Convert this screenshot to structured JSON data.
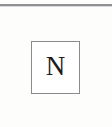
{
  "document": {
    "type": "scanned-page-fragment",
    "background_color": "#fdfdfc"
  },
  "rule": {
    "name": "horizontal-rule",
    "color": "#8f9093"
  },
  "label_box": {
    "name": "north-indicator-box",
    "letter": "N",
    "border_color": "#8a8b8e",
    "fill_color": "#ffffff",
    "text_color": "#1b1b1b"
  }
}
